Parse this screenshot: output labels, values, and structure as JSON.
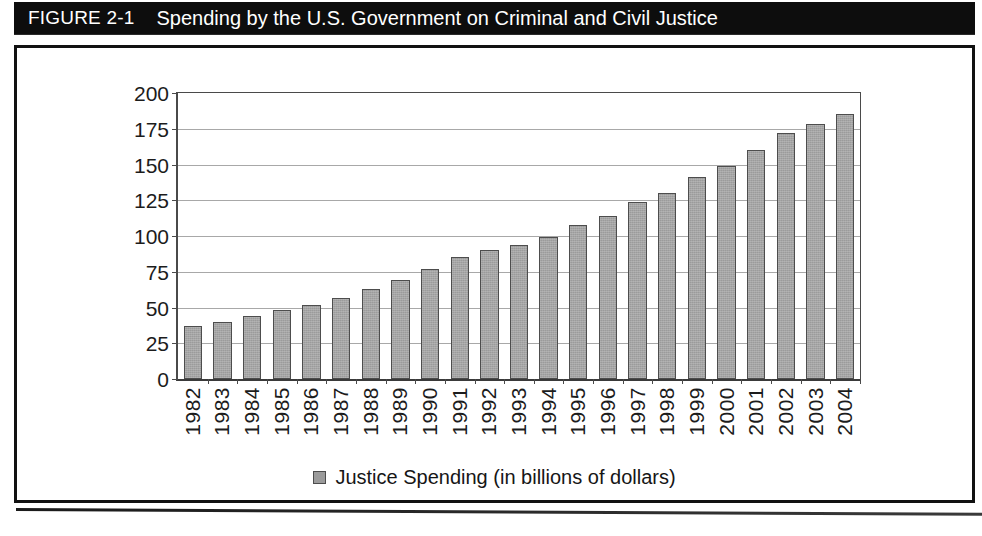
{
  "figure": {
    "label": "FIGURE 2-1",
    "title": "Spending by the U.S. Government on Criminal and Civil Justice"
  },
  "colors": {
    "bar_fill": "#9b9b9b",
    "bar_border": "#4d4d4d",
    "banner_background": "#0d0d0d",
    "banner_text": "#ffffff",
    "gridline": "#a8a8a8",
    "axis": "#4a4a4a"
  },
  "legend": {
    "position": "bottom-center",
    "entries": [
      {
        "swatch_name": "legend-swatch-justice-spending",
        "label": "Justice Spending (in billions of dollars)"
      }
    ]
  },
  "chart_data": {
    "type": "bar",
    "title": "Spending by the U.S. Government on Criminal and Civil Justice",
    "subtitle": "",
    "xlabel": "",
    "ylabel": "",
    "ylim": [
      0,
      200
    ],
    "ytick_values": [
      0,
      25,
      50,
      75,
      100,
      125,
      150,
      175,
      200
    ],
    "ytick_labels": [
      "0",
      "25",
      "50",
      "75",
      "100",
      "125",
      "150",
      "175",
      "200"
    ],
    "grid": true,
    "legend_position": "bottom",
    "series": [
      {
        "name": "Justice Spending (in billions of dollars)",
        "values": [
          37,
          40,
          44,
          48,
          52,
          57,
          63,
          69,
          77,
          85,
          90,
          94,
          99,
          108,
          114,
          124,
          130,
          141,
          149,
          160,
          172,
          178,
          185
        ]
      }
    ],
    "categories": [
      "1982",
      "1983",
      "1984",
      "1985",
      "1986",
      "1987",
      "1988",
      "1989",
      "1990",
      "1991",
      "1992",
      "1993",
      "1994",
      "1995",
      "1996",
      "1997",
      "1998",
      "1999",
      "2000",
      "2001",
      "2002",
      "2003",
      "2004"
    ]
  }
}
